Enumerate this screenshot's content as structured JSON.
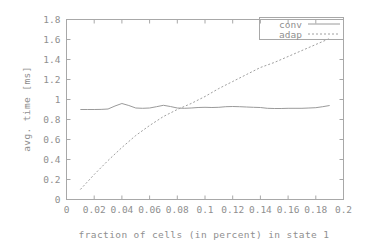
{
  "chart_data": {
    "type": "line",
    "title": "",
    "xlabel": "fraction of cells (in percent) in state 1",
    "ylabel": "avg. time [ms]",
    "xlim": [
      0,
      0.2
    ],
    "ylim": [
      0,
      1.8
    ],
    "grid": false,
    "legend_position": "top-right",
    "xticks": [
      "0",
      "0.02",
      "0.04",
      "0.06",
      "0.08",
      "0.1",
      "0.12",
      "0.14",
      "0.16",
      "0.18",
      "0.2"
    ],
    "xtick_values": [
      0,
      0.02,
      0.04,
      0.06,
      0.08,
      0.1,
      0.12,
      0.14,
      0.16,
      0.18,
      0.2
    ],
    "yticks": [
      "0",
      "0.2",
      "0.4",
      "0.6",
      "0.8",
      "1",
      "1.2",
      "1.4",
      "1.6",
      "1.8"
    ],
    "ytick_values": [
      0,
      0.2,
      0.4,
      0.6,
      0.8,
      1.0,
      1.2,
      1.4,
      1.6,
      1.8
    ],
    "series": [
      {
        "name": "conv",
        "style": "solid",
        "color": "#9a9a9a",
        "x": [
          0.01,
          0.015,
          0.02,
          0.025,
          0.03,
          0.035,
          0.04,
          0.045,
          0.05,
          0.055,
          0.06,
          0.065,
          0.07,
          0.075,
          0.08,
          0.085,
          0.09,
          0.095,
          0.1,
          0.105,
          0.11,
          0.115,
          0.12,
          0.125,
          0.13,
          0.135,
          0.14,
          0.145,
          0.15,
          0.155,
          0.16,
          0.165,
          0.17,
          0.175,
          0.18,
          0.185,
          0.19
        ],
        "values": [
          0.9,
          0.9,
          0.9,
          0.901,
          0.905,
          0.935,
          0.96,
          0.94,
          0.915,
          0.912,
          0.915,
          0.928,
          0.942,
          0.93,
          0.915,
          0.912,
          0.915,
          0.92,
          0.922,
          0.92,
          0.922,
          0.928,
          0.93,
          0.928,
          0.925,
          0.922,
          0.92,
          0.912,
          0.91,
          0.91,
          0.912,
          0.912,
          0.912,
          0.915,
          0.918,
          0.928,
          0.94
        ]
      },
      {
        "name": "adap",
        "style": "dotted",
        "color": "#a0a0a0",
        "x": [
          0.01,
          0.02,
          0.03,
          0.04,
          0.05,
          0.06,
          0.07,
          0.08,
          0.09,
          0.1,
          0.11,
          0.12,
          0.13,
          0.14,
          0.15,
          0.16,
          0.17,
          0.18,
          0.19
        ],
        "values": [
          0.1,
          0.25,
          0.39,
          0.52,
          0.64,
          0.74,
          0.83,
          0.9,
          0.96,
          1.03,
          1.11,
          1.18,
          1.25,
          1.32,
          1.37,
          1.43,
          1.49,
          1.55,
          1.61
        ]
      }
    ]
  },
  "legend": {
    "entries": [
      {
        "label": "conv"
      },
      {
        "label": "adap"
      }
    ]
  }
}
